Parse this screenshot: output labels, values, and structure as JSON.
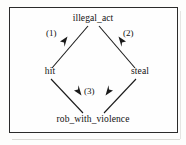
{
  "figure": {
    "type": "directed-graph",
    "border_color": "#2b2b2b",
    "background_color": "#fefefe",
    "line_color": "#1a1a1a"
  },
  "nodes": [
    {
      "id": "illegal_act",
      "label": "illegal_act",
      "position": "top"
    },
    {
      "id": "hit",
      "label": "hit",
      "position": "left"
    },
    {
      "id": "steal",
      "label": "steal",
      "position": "right"
    },
    {
      "id": "rob_with_violence",
      "label": "rob_with_violence",
      "position": "bottom"
    }
  ],
  "edges": [
    {
      "id": "e1",
      "label": "(1)",
      "from": "hit",
      "to": "illegal_act",
      "direction": "up-right"
    },
    {
      "id": "e2",
      "label": "(2)",
      "from": "steal",
      "to": "illegal_act",
      "direction": "up-left"
    },
    {
      "id": "e3a",
      "label": "(3)",
      "from": "hit",
      "to": "rob_with_violence",
      "direction": "down-right"
    },
    {
      "id": "e3b",
      "label": "",
      "from": "steal",
      "to": "rob_with_violence",
      "direction": "down-left"
    }
  ]
}
